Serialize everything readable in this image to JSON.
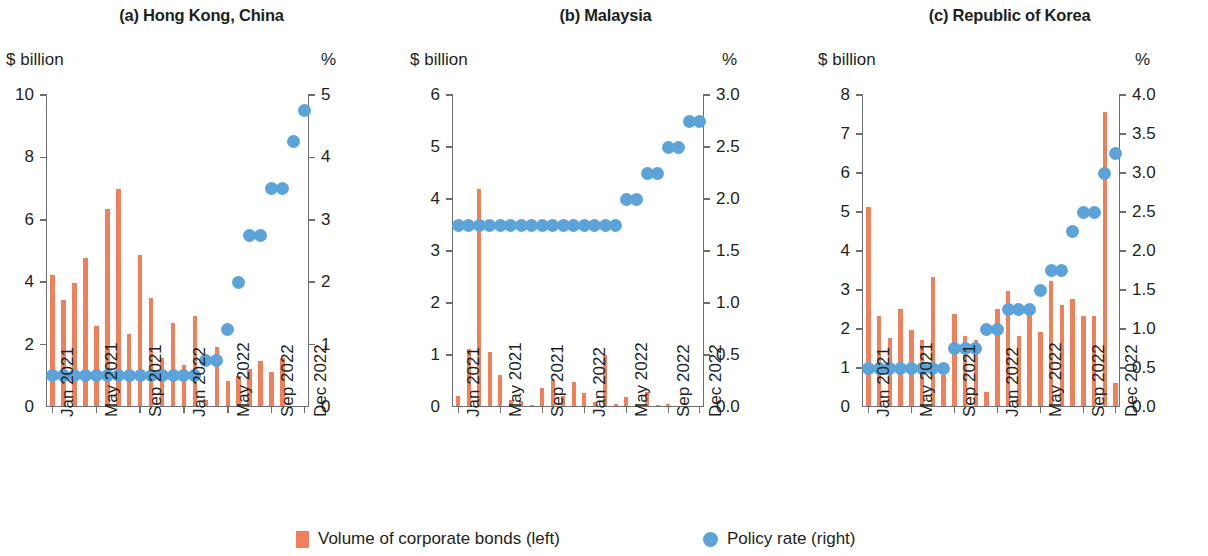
{
  "legend": {
    "bars_label": "Volume of corporate bonds (left)",
    "dots_label": "Policy rate (right)",
    "bars_icon": "orange-square-icon",
    "dots_icon": "blue-circle-icon"
  },
  "colors": {
    "bar": "#f0805a",
    "dot": "#5ba3d9",
    "axis": "#6d6e71",
    "text": "#231f20"
  },
  "chart_data": [
    {
      "type": "bar",
      "panel": "a",
      "title": "(a) Hong Kong, China",
      "ylabel": "$ billion",
      "y2label": "%",
      "ylim": [
        0,
        10
      ],
      "y2lim": [
        0,
        5
      ],
      "yticks": [
        "0",
        "2",
        "4",
        "6",
        "8",
        "10"
      ],
      "ytick_values": [
        0,
        2,
        4,
        6,
        8,
        10
      ],
      "y2ticks": [
        "0",
        "1",
        "2",
        "3",
        "4",
        "5"
      ],
      "y2tick_values": [
        0,
        1,
        2,
        3,
        4,
        5
      ],
      "xlabel": "",
      "grid": false,
      "legend_position": "bottom",
      "xticklabels": [
        "Jan 2021",
        "May 2021",
        "Sep 2021",
        "Jan 2022",
        "May 2022",
        "Sep 2022",
        "Dec 2022"
      ],
      "xtick_indices": [
        0,
        4,
        8,
        12,
        16,
        20,
        23
      ],
      "categories": [
        "Jan 2021",
        "Feb 2021",
        "Mar 2021",
        "Apr 2021",
        "May 2021",
        "Jun 2021",
        "Jul 2021",
        "Aug 2021",
        "Sep 2021",
        "Oct 2021",
        "Nov 2021",
        "Dec 2021",
        "Jan 2022",
        "Feb 2022",
        "Mar 2022",
        "Apr 2022",
        "May 2022",
        "Jun 2022",
        "Jul 2022",
        "Aug 2022",
        "Sep 2022",
        "Oct 2022",
        "Nov 2022",
        "Dec 2022"
      ],
      "series": [
        {
          "name": "Volume of corporate bonds (left)",
          "axis": "left",
          "render": "bar",
          "values": [
            4.2,
            3.4,
            3.95,
            4.75,
            2.55,
            6.3,
            6.95,
            2.3,
            4.85,
            3.45,
            1.55,
            2.65,
            1.3,
            2.9,
            0.2,
            1.9,
            0.8,
            0.95,
            1.2,
            1.45,
            1.1,
            1.55,
            0.0,
            0.0
          ]
        },
        {
          "name": "Policy rate (right)",
          "axis": "right",
          "render": "dot",
          "values": [
            0.5,
            0.5,
            0.5,
            0.5,
            0.5,
            0.5,
            0.5,
            0.5,
            0.5,
            0.5,
            0.5,
            0.5,
            0.5,
            0.5,
            0.75,
            0.75,
            1.25,
            2.0,
            2.75,
            2.75,
            3.5,
            3.5,
            4.25,
            4.75
          ]
        }
      ]
    },
    {
      "type": "bar",
      "panel": "b",
      "title": "(b) Malaysia",
      "ylabel": "$ billion",
      "y2label": "%",
      "ylim": [
        0,
        6
      ],
      "y2lim": [
        0,
        3.0
      ],
      "yticks": [
        "0",
        "1",
        "2",
        "3",
        "4",
        "5",
        "6"
      ],
      "ytick_values": [
        0,
        1,
        2,
        3,
        4,
        5,
        6
      ],
      "y2ticks": [
        "0.0",
        "0.5",
        "1.0",
        "1.5",
        "2.0",
        "2.5",
        "3.0"
      ],
      "y2tick_values": [
        0,
        0.5,
        1.0,
        1.5,
        2.0,
        2.5,
        3.0
      ],
      "xlabel": "",
      "grid": false,
      "legend_position": "bottom",
      "xticklabels": [
        "Jan 2021",
        "May 2021",
        "Sep 2021",
        "Jan 2022",
        "May 2022",
        "Sep 2022",
        "Dec 2022"
      ],
      "xtick_indices": [
        0,
        4,
        8,
        12,
        16,
        20,
        23
      ],
      "categories": [
        "Jan 2021",
        "Feb 2021",
        "Mar 2021",
        "Apr 2021",
        "May 2021",
        "Jun 2021",
        "Jul 2021",
        "Aug 2021",
        "Sep 2021",
        "Oct 2021",
        "Nov 2021",
        "Dec 2021",
        "Jan 2022",
        "Feb 2022",
        "Mar 2022",
        "Apr 2022",
        "May 2022",
        "Jun 2022",
        "Jul 2022",
        "Aug 2022",
        "Sep 2022",
        "Oct 2022",
        "Nov 2022",
        "Dec 2022"
      ],
      "series": [
        {
          "name": "Volume of corporate bonds (left)",
          "axis": "left",
          "render": "bar",
          "values": [
            0.2,
            1.1,
            4.18,
            1.03,
            0.6,
            0.12,
            0.1,
            0.02,
            0.35,
            0.5,
            0.2,
            0.47,
            0.25,
            0.07,
            0.98,
            0.03,
            0.18,
            0.0,
            0.26,
            0.02,
            0.03,
            0.0,
            0.0,
            0.0
          ]
        },
        {
          "name": "Policy rate (right)",
          "axis": "right",
          "render": "dot",
          "values": [
            1.75,
            1.75,
            1.75,
            1.75,
            1.75,
            1.75,
            1.75,
            1.75,
            1.75,
            1.75,
            1.75,
            1.75,
            1.75,
            1.75,
            1.75,
            1.75,
            2.0,
            2.0,
            2.25,
            2.25,
            2.5,
            2.5,
            2.75,
            2.75
          ]
        }
      ]
    },
    {
      "type": "bar",
      "panel": "c",
      "title": "(c) Republic of Korea",
      "ylabel": "$ billion",
      "y2label": "%",
      "ylim": [
        0,
        8
      ],
      "y2lim": [
        0,
        4.0
      ],
      "yticks": [
        "0",
        "1",
        "2",
        "3",
        "4",
        "5",
        "6",
        "7",
        "8"
      ],
      "ytick_values": [
        0,
        1,
        2,
        3,
        4,
        5,
        6,
        7,
        8
      ],
      "y2ticks": [
        "0.0",
        "0.5",
        "1.0",
        "1.5",
        "2.0",
        "2.5",
        "3.0",
        "3.5",
        "4.0"
      ],
      "y2tick_values": [
        0,
        0.5,
        1.0,
        1.5,
        2.0,
        2.5,
        3.0,
        3.5,
        4.0
      ],
      "xlabel": "",
      "grid": false,
      "legend_position": "bottom",
      "xticklabels": [
        "Jan 2021",
        "May 2021",
        "Sep 2021",
        "Jan 2022",
        "May 2022",
        "Sep 2022",
        "Dec 2022"
      ],
      "xtick_indices": [
        0,
        4,
        8,
        12,
        16,
        20,
        23
      ],
      "categories": [
        "Jan 2021",
        "Feb 2021",
        "Mar 2021",
        "Apr 2021",
        "May 2021",
        "Jun 2021",
        "Jul 2021",
        "Aug 2021",
        "Sep 2021",
        "Oct 2021",
        "Nov 2021",
        "Dec 2021",
        "Jan 2022",
        "Feb 2022",
        "Mar 2022",
        "Apr 2022",
        "May 2022",
        "Jun 2022",
        "Jul 2022",
        "Aug 2022",
        "Sep 2022",
        "Oct 2022",
        "Nov 2022",
        "Dec 2022"
      ],
      "series": [
        {
          "name": "Volume of corporate bonds (left)",
          "axis": "left",
          "render": "bar",
          "values": [
            5.1,
            2.3,
            1.75,
            2.5,
            1.95,
            1.7,
            3.3,
            0.8,
            2.35,
            1.8,
            1.7,
            0.35,
            2.5,
            2.95,
            1.8,
            2.6,
            1.9,
            3.2,
            2.6,
            2.75,
            2.3,
            2.3,
            7.55,
            0.6
          ]
        },
        {
          "name": "Policy rate (right)",
          "axis": "right",
          "render": "dot",
          "values": [
            0.5,
            0.5,
            0.5,
            0.5,
            0.5,
            0.5,
            0.5,
            0.5,
            0.75,
            0.75,
            0.75,
            1.0,
            1.0,
            1.25,
            1.25,
            1.25,
            1.5,
            1.75,
            1.75,
            2.25,
            2.5,
            2.5,
            3.0,
            3.25
          ]
        }
      ]
    }
  ]
}
